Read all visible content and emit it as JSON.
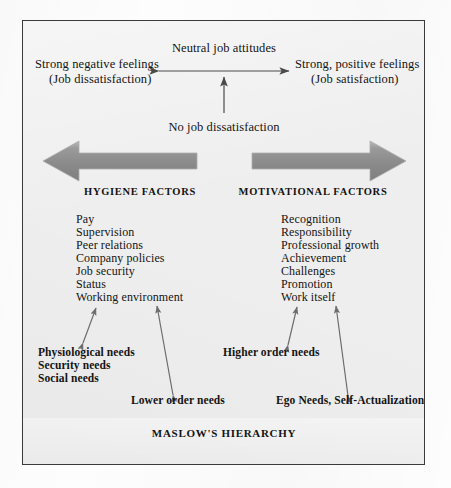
{
  "diagram": {
    "top": {
      "center_label": "Neutral job attitudes",
      "left_label_line1": "Strong negative feelings",
      "left_label_line2": "(Job dissatisfaction)",
      "right_label_line1": "Strong, positive feelings",
      "right_label_line2": "(Job satisfaction)",
      "bottom_label": "No job dissatisfaction"
    },
    "columns": {
      "hygiene": {
        "heading": "HYGIENE FACTORS",
        "items": [
          "Pay",
          "Supervision",
          "Peer relations",
          "Company policies",
          "Job security",
          "Status",
          "Working environment"
        ]
      },
      "motivational": {
        "heading": "MOTIVATIONAL FACTORS",
        "items": [
          "Recognition",
          "Responsibility",
          "Professional growth",
          "Achievement",
          "Challenges",
          "Promotion",
          "Work itself"
        ]
      }
    },
    "needs": {
      "lower_list": [
        "Physiological needs",
        "Security needs",
        "Social needs"
      ],
      "higher_label": "Higher order needs",
      "lower_order_label": "Lower order needs",
      "ego_label": "Ego Needs, Self-Actualization"
    },
    "footer": "MASLOW'S HIERARCHY",
    "colors": {
      "block_arrow_fill": "#8d8d8d",
      "block_arrow_edge": "#b4b4b4",
      "thin_arrow": "#4a4a4a",
      "diagonal_arrow": "#6d6d6d",
      "panel_background": "#eeeeee",
      "panel_border": "#3a3a3a",
      "text": "#141414"
    }
  }
}
